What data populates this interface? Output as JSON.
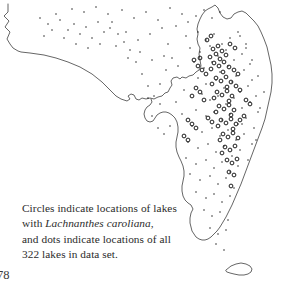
{
  "figure": {
    "domain_kind": "map",
    "region_name": "Florida",
    "background_color": "#ffffff",
    "outline_color": "#4a4a4a",
    "marker_color": "#1c1c1c",
    "text_color": "#2b2b2b"
  },
  "caption": {
    "line1": "Circles indicate locations of lakes",
    "line2_prefix": "with ",
    "line2_species": "Lachnanthes caroliana",
    "line2_suffix": ",",
    "line3": "and dots indicate locations of all",
    "line4": "322 lakes in data set.",
    "total_lakes": "322"
  },
  "folio": {
    "page_number": "78"
  },
  "legend_semantics": {
    "circles": "locations of lakes with Lachnanthes caroliana",
    "dots": "locations of all 322 lakes in data set"
  },
  "map_data": {
    "type": "outline-point-map",
    "mainland_outline": "M 8,4 L 8,12 L 4,16 L 9,21 L 5,27 L 10,32 L 7,39 L 10,44 L 13,48 L 18,51 L 21,52 L 30,53 L 44,55 L 56,58 L 68,62 L 80,67 L 92,74 L 102,82 L 110,90 L 116,96 L 121,99 L 127,101 L 130,99 L 128,96 L 131,94 L 134,95 L 136,99 L 139,100 L 142,98 L 146,99 L 150,98 L 154,99 L 158,97 L 162,96 L 165,93 L 168,92 L 170,88 L 172,85 L 171,81 L 173,78 L 177,77 L 180,79 L 182,77 L 186,78 L 189,76 L 193,75 L 196,72 L 199,70 L 201,66 L 200,60 L 199,54 L 200,48 L 198,44 L 197,39 L 198,34 L 197,29 L 198,24 L 200,19 L 202,15 L 205,11 L 208,9 L 212,7 L 215,5 L 218,8 L 220,13 L 223,17 L 227,19 L 231,18 L 234,14 L 238,12 L 242,11 L 246,13 L 250,17 L 254,21 L 258,26 L 261,32 L 264,39 L 267,47 L 269,56 L 271,65 L 272,74 L 272,83 L 271,92 L 269,101 L 267,110 L 265,119 L 262,128 L 259,136 L 256,144 L 253,152 L 250,160 L 247,168 L 244,176 L 241,184 L 238,191 L 235,198 L 232,205 L 229,211 L 226,217 L 223,222 L 220,227 L 217,231 L 214,234 L 211,237 L 208,239 L 205,240 L 202,240 L 199,239 L 196,237 L 194,234 L 192,231 L 191,227 L 190,223 L 190,218 L 191,213 L 193,209 L 191,205 L 188,203 L 185,200 L 183,196 L 182,191 L 182,186 L 183,181 L 184,176 L 184,171 L 183,166 L 181,161 L 179,157 L 177,152 L 176,147 L 176,142 L 177,137 L 178,132 L 178,127 L 177,122 L 175,118 L 172,115 L 169,113 L 166,112 L 163,112 L 160,113 L 157,115 L 155,118 L 153,121 L 150,122 L 147,121 L 145,118 L 144,114 L 145,110 L 147,107 L 150,105 L 152,102 L 151,99",
    "keys_outline": "M 226,270 L 231,266 L 236,264 L 241,263 L 246,264 L 250,266 L 252,269 L 251,272 L 248,274 L 244,275 L 239,275 L 234,274 L 230,273 L 227,272 Z",
    "dots_note": "small solid dots mark all 322 surveyed lakes",
    "circles_note": "larger open circles mark lakes containing the species",
    "dots": [
      [
        72,
        9
      ],
      [
        84,
        12
      ],
      [
        96,
        7
      ],
      [
        108,
        14
      ],
      [
        60,
        20
      ],
      [
        74,
        24
      ],
      [
        86,
        27
      ],
      [
        98,
        22
      ],
      [
        110,
        28
      ],
      [
        122,
        10
      ],
      [
        134,
        18
      ],
      [
        146,
        12
      ],
      [
        158,
        20
      ],
      [
        150,
        34
      ],
      [
        162,
        28
      ],
      [
        138,
        40
      ],
      [
        126,
        32
      ],
      [
        170,
        8
      ],
      [
        182,
        14
      ],
      [
        176,
        26
      ],
      [
        188,
        22
      ],
      [
        196,
        16
      ],
      [
        204,
        10
      ],
      [
        212,
        18
      ],
      [
        220,
        12
      ],
      [
        186,
        36
      ],
      [
        198,
        32
      ],
      [
        206,
        40
      ],
      [
        214,
        34
      ],
      [
        222,
        44
      ],
      [
        230,
        38
      ],
      [
        238,
        32
      ],
      [
        246,
        44
      ],
      [
        190,
        48
      ],
      [
        200,
        52
      ],
      [
        210,
        46
      ],
      [
        218,
        56
      ],
      [
        226,
        50
      ],
      [
        234,
        60
      ],
      [
        242,
        54
      ],
      [
        250,
        64
      ],
      [
        194,
        62
      ],
      [
        204,
        68
      ],
      [
        212,
        62
      ],
      [
        220,
        72
      ],
      [
        228,
        66
      ],
      [
        236,
        76
      ],
      [
        244,
        70
      ],
      [
        252,
        80
      ],
      [
        198,
        78
      ],
      [
        206,
        84
      ],
      [
        216,
        80
      ],
      [
        224,
        88
      ],
      [
        232,
        82
      ],
      [
        240,
        92
      ],
      [
        248,
        86
      ],
      [
        256,
        96
      ],
      [
        202,
        94
      ],
      [
        210,
        100
      ],
      [
        218,
        96
      ],
      [
        226,
        104
      ],
      [
        234,
        98
      ],
      [
        242,
        108
      ],
      [
        250,
        102
      ],
      [
        258,
        112
      ],
      [
        196,
        110
      ],
      [
        206,
        116
      ],
      [
        214,
        112
      ],
      [
        222,
        120
      ],
      [
        230,
        114
      ],
      [
        238,
        124
      ],
      [
        246,
        118
      ],
      [
        254,
        128
      ],
      [
        192,
        126
      ],
      [
        202,
        132
      ],
      [
        212,
        128
      ],
      [
        220,
        136
      ],
      [
        228,
        130
      ],
      [
        236,
        140
      ],
      [
        244,
        134
      ],
      [
        252,
        144
      ],
      [
        188,
        142
      ],
      [
        198,
        148
      ],
      [
        208,
        144
      ],
      [
        216,
        152
      ],
      [
        224,
        146
      ],
      [
        232,
        156
      ],
      [
        240,
        150
      ],
      [
        248,
        160
      ],
      [
        186,
        158
      ],
      [
        196,
        164
      ],
      [
        206,
        160
      ],
      [
        214,
        168
      ],
      [
        222,
        162
      ],
      [
        230,
        172
      ],
      [
        238,
        166
      ],
      [
        190,
        174
      ],
      [
        200,
        180
      ],
      [
        210,
        176
      ],
      [
        218,
        184
      ],
      [
        226,
        178
      ],
      [
        234,
        188
      ],
      [
        196,
        192
      ],
      [
        206,
        198
      ],
      [
        214,
        194
      ],
      [
        222,
        202
      ],
      [
        230,
        196
      ],
      [
        204,
        210
      ],
      [
        212,
        216
      ],
      [
        220,
        212
      ],
      [
        228,
        220
      ],
      [
        210,
        228
      ],
      [
        218,
        234
      ],
      [
        226,
        230
      ],
      [
        216,
        244
      ],
      [
        224,
        250
      ],
      [
        242,
        124
      ],
      [
        256,
        140
      ],
      [
        260,
        108
      ],
      [
        264,
        92
      ],
      [
        258,
        76
      ],
      [
        252,
        60
      ],
      [
        246,
        48
      ],
      [
        240,
        36
      ],
      [
        168,
        44
      ],
      [
        172,
        58
      ],
      [
        166,
        70
      ],
      [
        178,
        66
      ],
      [
        184,
        90
      ],
      [
        176,
        102
      ],
      [
        182,
        114
      ],
      [
        170,
        126
      ],
      [
        164,
        134
      ],
      [
        158,
        128
      ],
      [
        152,
        116
      ],
      [
        160,
        104
      ],
      [
        154,
        96
      ],
      [
        148,
        86
      ],
      [
        142,
        74
      ],
      [
        136,
        62
      ],
      [
        130,
        50
      ],
      [
        124,
        42
      ],
      [
        118,
        34
      ],
      [
        112,
        22
      ],
      [
        104,
        32
      ],
      [
        92,
        38
      ],
      [
        80,
        34
      ],
      [
        68,
        30
      ],
      [
        56,
        14
      ],
      [
        48,
        24
      ],
      [
        40,
        18
      ],
      [
        44,
        36
      ],
      [
        52,
        30
      ],
      [
        64,
        38
      ],
      [
        76,
        44
      ],
      [
        88,
        48
      ],
      [
        100,
        44
      ],
      [
        116,
        46
      ],
      [
        128,
        58
      ],
      [
        140,
        52
      ],
      [
        152,
        60
      ],
      [
        164,
        56
      ],
      [
        160,
        84
      ],
      [
        148,
        98
      ]
    ],
    "circles": [
      [
        213,
        49
      ],
      [
        218,
        46
      ],
      [
        222,
        51
      ],
      [
        216,
        54
      ],
      [
        210,
        57
      ],
      [
        220,
        59
      ],
      [
        226,
        55
      ],
      [
        214,
        63
      ],
      [
        219,
        66
      ],
      [
        224,
        62
      ],
      [
        229,
        67
      ],
      [
        211,
        69
      ],
      [
        223,
        72
      ],
      [
        216,
        78
      ],
      [
        221,
        81
      ],
      [
        226,
        77
      ],
      [
        231,
        82
      ],
      [
        212,
        84
      ],
      [
        227,
        87
      ],
      [
        217,
        92
      ],
      [
        222,
        95
      ],
      [
        227,
        91
      ],
      [
        232,
        96
      ],
      [
        214,
        98
      ],
      [
        229,
        101
      ],
      [
        219,
        106
      ],
      [
        224,
        109
      ],
      [
        229,
        105
      ],
      [
        234,
        110
      ],
      [
        216,
        112
      ],
      [
        231,
        115
      ],
      [
        221,
        120
      ],
      [
        226,
        123
      ],
      [
        231,
        119
      ],
      [
        236,
        124
      ],
      [
        218,
        126
      ],
      [
        233,
        129
      ],
      [
        223,
        134
      ],
      [
        228,
        137
      ],
      [
        233,
        133
      ],
      [
        238,
        138
      ],
      [
        220,
        140
      ],
      [
        225,
        147
      ],
      [
        230,
        150
      ],
      [
        235,
        146
      ],
      [
        222,
        153
      ],
      [
        227,
        160
      ],
      [
        232,
        163
      ],
      [
        237,
        159
      ],
      [
        229,
        172
      ],
      [
        234,
        175
      ],
      [
        231,
        186
      ],
      [
        202,
        70
      ],
      [
        206,
        74
      ],
      [
        198,
        66
      ],
      [
        194,
        60
      ],
      [
        200,
        58
      ],
      [
        196,
        88
      ],
      [
        200,
        92
      ],
      [
        192,
        96
      ],
      [
        204,
        100
      ],
      [
        188,
        120
      ],
      [
        192,
        124
      ],
      [
        196,
        128
      ],
      [
        184,
        136
      ],
      [
        188,
        140
      ],
      [
        208,
        118
      ],
      [
        212,
        122
      ],
      [
        240,
        120
      ],
      [
        244,
        116
      ],
      [
        246,
        100
      ],
      [
        250,
        104
      ],
      [
        236,
        86
      ],
      [
        240,
        90
      ],
      [
        234,
        70
      ],
      [
        238,
        74
      ],
      [
        230,
        44
      ],
      [
        235,
        48
      ],
      [
        207,
        40
      ],
      [
        211,
        36
      ]
    ]
  }
}
